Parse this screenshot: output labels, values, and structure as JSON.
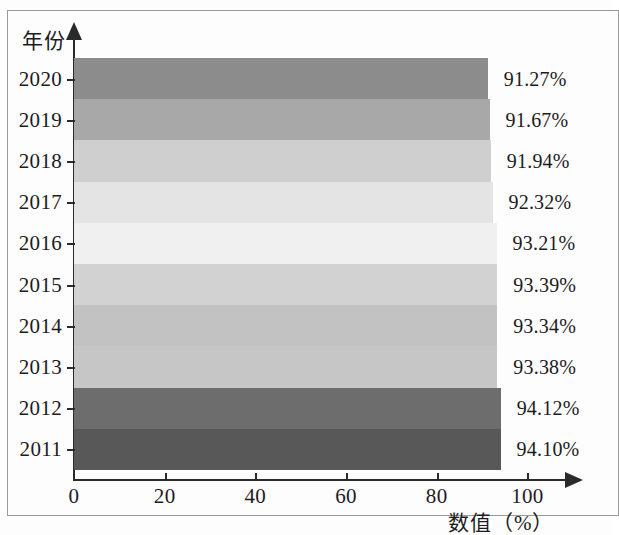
{
  "chart_data": {
    "type": "bar",
    "orientation": "horizontal",
    "title": "",
    "xlabel": "数值（%）",
    "ylabel": "年份",
    "categories": [
      "2011",
      "2012",
      "2013",
      "2014",
      "2015",
      "2016",
      "2017",
      "2018",
      "2019",
      "2020"
    ],
    "values": [
      94.1,
      94.12,
      93.38,
      93.34,
      93.39,
      93.21,
      92.32,
      91.94,
      91.67,
      91.27
    ],
    "value_labels": [
      "94.10%",
      "94.12%",
      "93.38%",
      "93.34%",
      "93.39%",
      "93.21%",
      "92.32%",
      "91.94%",
      "91.67%",
      "91.27%"
    ],
    "bar_colors": [
      "#585858",
      "#6d6d6d",
      "#c6c6c6",
      "#c2c2c2",
      "#d2d2d2",
      "#f0f0f0",
      "#e4e4e4",
      "#cfcfcf",
      "#a8a8a8",
      "#8c8c8c"
    ],
    "xlim": [
      0,
      105
    ],
    "xticks": [
      0,
      20,
      40,
      60,
      80,
      100
    ],
    "xtick_labels": [
      "0",
      "20",
      "40",
      "60",
      "80",
      "100"
    ],
    "grid": false,
    "legend": "none",
    "axis_arrows": true
  },
  "axes": {
    "y_title": "年份",
    "x_title": "数值（%）"
  },
  "rows": [
    {
      "year": "2020",
      "value": 91.27,
      "label": "91.27%",
      "color": "#8c8c8c"
    },
    {
      "year": "2019",
      "value": 91.67,
      "label": "91.67%",
      "color": "#a8a8a8"
    },
    {
      "year": "2018",
      "value": 91.94,
      "label": "91.94%",
      "color": "#cfcfcf"
    },
    {
      "year": "2017",
      "value": 92.32,
      "label": "92.32%",
      "color": "#e4e4e4"
    },
    {
      "year": "2016",
      "value": 93.21,
      "label": "93.21%",
      "color": "#f0f0f0"
    },
    {
      "year": "2015",
      "value": 93.39,
      "label": "93.39%",
      "color": "#d2d2d2"
    },
    {
      "year": "2014",
      "value": 93.34,
      "label": "93.34%",
      "color": "#c2c2c2"
    },
    {
      "year": "2013",
      "value": 93.38,
      "label": "93.38%",
      "color": "#c6c6c6"
    },
    {
      "year": "2012",
      "value": 94.12,
      "label": "94.12%",
      "color": "#6d6d6d"
    },
    {
      "year": "2011",
      "value": 94.1,
      "label": "94.10%",
      "color": "#585858"
    }
  ],
  "xticks": [
    {
      "label": "0",
      "value": 0
    },
    {
      "label": "20",
      "value": 20
    },
    {
      "label": "40",
      "value": 40
    },
    {
      "label": "60",
      "value": 60
    },
    {
      "label": "80",
      "value": 80
    },
    {
      "label": "100",
      "value": 100
    }
  ]
}
